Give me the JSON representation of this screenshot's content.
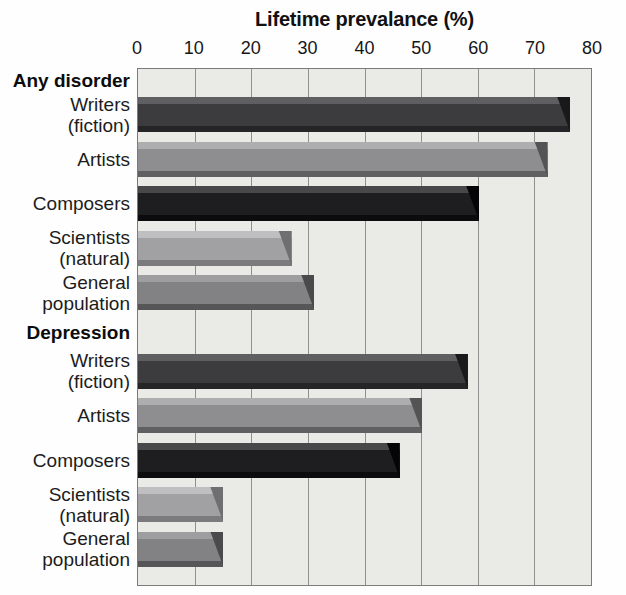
{
  "title": "Lifetime prevalance (%)",
  "colors": {
    "plot_background": "#eaeae7",
    "plot_border": "#7b7b79",
    "gridline": "#90908e",
    "text": "#141414"
  },
  "chart_data": {
    "type": "bar",
    "orientation": "horizontal",
    "title": "Lifetime prevalance (%)",
    "xlabel": "Lifetime prevalance (%)",
    "xlim": [
      0,
      80
    ],
    "xticks": [
      0,
      10,
      20,
      30,
      40,
      50,
      60,
      70,
      80
    ],
    "grid": "vertical gridlines at each 10%",
    "legend": "none",
    "groups": [
      {
        "label": "Any disorder",
        "bars": [
          {
            "category": "Writers (fiction)",
            "label_lines": [
              "Writers",
              "(fiction)"
            ],
            "value": 76,
            "color_top": "#5f5f61",
            "color_face": "#3c3c3e",
            "color_bottom": "#252527",
            "color_end": "#19191b"
          },
          {
            "category": "Artists",
            "label_lines": [
              "Artists"
            ],
            "value": 72,
            "color_top": "#aeaeb0",
            "color_face": "#8e8e90",
            "color_bottom": "#606062",
            "color_end": "#545456"
          },
          {
            "category": "Composers",
            "label_lines": [
              "Composers"
            ],
            "value": 60,
            "color_top": "#48484a",
            "color_face": "#1e1e20",
            "color_bottom": "#0c0c0e",
            "color_end": "#050507"
          },
          {
            "category": "Scientists (natural)",
            "label_lines": [
              "Scientists",
              "(natural)"
            ],
            "value": 27,
            "color_top": "#bfbfc1",
            "color_face": "#a1a1a3",
            "color_bottom": "#7b7b7d",
            "color_end": "#6f6f71"
          },
          {
            "category": "General population",
            "label_lines": [
              "General",
              "population"
            ],
            "value": 31,
            "color_top": "#9e9ea0",
            "color_face": "#828284",
            "color_bottom": "#565658",
            "color_end": "#4a4a4c"
          }
        ]
      },
      {
        "label": "Depression",
        "bars": [
          {
            "category": "Writers (fiction)",
            "label_lines": [
              "Writers",
              "(fiction)"
            ],
            "value": 58,
            "color_top": "#5f5f61",
            "color_face": "#3c3c3e",
            "color_bottom": "#252527",
            "color_end": "#19191b"
          },
          {
            "category": "Artists",
            "label_lines": [
              "Artists"
            ],
            "value": 50,
            "color_top": "#aeaeb0",
            "color_face": "#8e8e90",
            "color_bottom": "#606062",
            "color_end": "#545456"
          },
          {
            "category": "Composers",
            "label_lines": [
              "Composers"
            ],
            "value": 46,
            "color_top": "#48484a",
            "color_face": "#1e1e20",
            "color_bottom": "#0c0c0e",
            "color_end": "#050507"
          },
          {
            "category": "Scientists (natural)",
            "label_lines": [
              "Scientists",
              "(natural)"
            ],
            "value": 15,
            "color_top": "#bfbfc1",
            "color_face": "#a1a1a3",
            "color_bottom": "#7b7b7d",
            "color_end": "#6f6f71"
          },
          {
            "category": "General population",
            "label_lines": [
              "General",
              "population"
            ],
            "value": 15,
            "color_top": "#9e9ea0",
            "color_face": "#828284",
            "color_bottom": "#565658",
            "color_end": "#4a4a4c"
          }
        ]
      }
    ]
  }
}
